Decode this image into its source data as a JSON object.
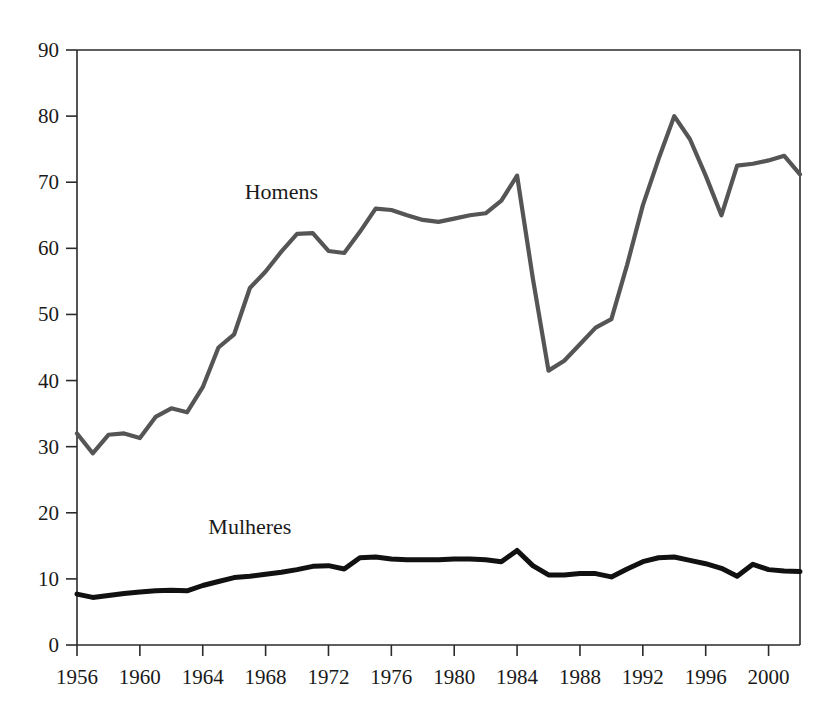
{
  "chart_data": {
    "type": "line",
    "title": "",
    "subtitle": "",
    "xlabel": "",
    "ylabel": "",
    "xlim": [
      1956,
      2002
    ],
    "ylim": [
      0,
      90
    ],
    "grid": false,
    "legend_position": "inline-annotation",
    "x_ticks": [
      "1956",
      "1960",
      "1964",
      "1968",
      "1972",
      "1976",
      "1980",
      "1984",
      "1988",
      "1992",
      "1996",
      "2000"
    ],
    "x_tick_values": [
      1956,
      1960,
      1964,
      1968,
      1972,
      1976,
      1980,
      1984,
      1988,
      1992,
      1996,
      2000
    ],
    "y_ticks": [
      "0",
      "10",
      "20",
      "30",
      "40",
      "50",
      "60",
      "70",
      "80",
      "90"
    ],
    "y_tick_values": [
      0,
      10,
      20,
      30,
      40,
      50,
      60,
      70,
      80,
      90
    ],
    "x": [
      1956,
      1957,
      1958,
      1959,
      1960,
      1961,
      1962,
      1963,
      1964,
      1965,
      1966,
      1967,
      1968,
      1969,
      1970,
      1971,
      1972,
      1973,
      1974,
      1975,
      1976,
      1977,
      1978,
      1979,
      1980,
      1981,
      1982,
      1983,
      1984,
      1985,
      1986,
      1987,
      1988,
      1989,
      1990,
      1991,
      1992,
      1993,
      1994,
      1995,
      1996,
      1997,
      1998,
      1999,
      2000,
      2001,
      2002
    ],
    "series": [
      {
        "name": "Homens",
        "color": "#555555",
        "line_width": 4.2,
        "label_x": 1969,
        "label_y": 67.5,
        "values": [
          32.0,
          29.0,
          31.8,
          32.0,
          31.3,
          34.5,
          35.8,
          35.2,
          39.0,
          45.0,
          47.0,
          54.0,
          56.5,
          59.5,
          62.2,
          62.3,
          59.6,
          59.3,
          62.5,
          66.0,
          65.8,
          65.0,
          64.3,
          64.0,
          64.5,
          65.0,
          65.3,
          67.2,
          71.0,
          55.5,
          41.5,
          43.0,
          45.5,
          48.0,
          49.3,
          57.5,
          66.5,
          73.5,
          80.0,
          76.5,
          71.0,
          65.0,
          72.5,
          72.8,
          73.3,
          74.0,
          71.2
        ]
      },
      {
        "name": "Mulheres",
        "color": "#111111",
        "line_width": 5.0,
        "label_x": 1967,
        "label_y": 16.8,
        "values": [
          7.7,
          7.2,
          7.5,
          7.8,
          8.0,
          8.2,
          8.3,
          8.2,
          9.0,
          9.6,
          10.2,
          10.4,
          10.7,
          11.0,
          11.4,
          11.9,
          12.0,
          11.5,
          13.2,
          13.3,
          13.0,
          12.9,
          12.9,
          12.9,
          13.0,
          13.0,
          12.9,
          12.6,
          14.3,
          12.0,
          10.6,
          10.6,
          10.8,
          10.8,
          10.3,
          11.5,
          12.6,
          13.2,
          13.3,
          12.8,
          12.3,
          11.6,
          10.4,
          12.2,
          11.4,
          11.2,
          11.1
        ]
      }
    ]
  }
}
